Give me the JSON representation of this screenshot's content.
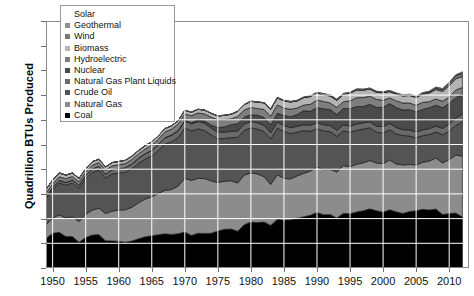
{
  "chart": {
    "title": "",
    "ylabel": "Quadrillion BTUs Produced",
    "xlabel": ""
  },
  "legend": {
    "title": "",
    "items": [
      {
        "label": "Solar",
        "color": "#ffffff"
      },
      {
        "label": "Geothermal",
        "color": "#8f8f8f"
      },
      {
        "label": "Wind",
        "color": "#787878"
      },
      {
        "label": "Biomass",
        "color": "#b4b4b4"
      },
      {
        "label": "Hydroelectric",
        "color": "#7e7e7e"
      },
      {
        "label": "Nuclear",
        "color": "#4a4a4a"
      },
      {
        "label": "Natural Gas Plant Liquids",
        "color": "#6a6a6a"
      },
      {
        "label": "Crude Oil",
        "color": "#545454"
      },
      {
        "label": "Natural Gas",
        "color": "#8c8c8c"
      },
      {
        "label": "Coal",
        "color": "#000000"
      }
    ]
  },
  "chart_data": {
    "type": "area",
    "title": "",
    "xlabel": "",
    "ylabel": "Quadrillion BTUs Produced",
    "xlim": [
      1949,
      2013
    ],
    "ylim": [
      0,
      100
    ],
    "yticks": [
      0,
      10,
      20,
      30,
      40,
      50,
      60,
      70,
      80,
      90,
      100
    ],
    "xticks": [
      1950,
      1955,
      1960,
      1965,
      1970,
      1975,
      1980,
      1985,
      1990,
      1995,
      2000,
      2005,
      2010
    ],
    "grid": true,
    "legend_position": "upper-left",
    "stacked": true,
    "stack_order_bottom_to_top": [
      "Coal",
      "Natural Gas",
      "Crude Oil",
      "Natural Gas Plant Liquids",
      "Nuclear",
      "Hydroelectric",
      "Biomass",
      "Wind",
      "Geothermal",
      "Solar"
    ],
    "x": [
      1949,
      1950,
      1951,
      1952,
      1953,
      1954,
      1955,
      1956,
      1957,
      1958,
      1959,
      1960,
      1961,
      1962,
      1963,
      1964,
      1965,
      1966,
      1967,
      1968,
      1969,
      1970,
      1971,
      1972,
      1973,
      1974,
      1975,
      1976,
      1977,
      1978,
      1979,
      1980,
      1981,
      1982,
      1983,
      1984,
      1985,
      1986,
      1987,
      1988,
      1989,
      1990,
      1991,
      1992,
      1993,
      1994,
      1995,
      1996,
      1997,
      1998,
      1999,
      2000,
      2001,
      2002,
      2003,
      2004,
      2005,
      2006,
      2007,
      2008,
      2009,
      2010,
      2011,
      2012
    ],
    "series": [
      {
        "name": "Coal",
        "color": "#000000",
        "values": [
          11.97,
          14.06,
          14.43,
          12.73,
          12.75,
          10.45,
          12.37,
          13.31,
          13.55,
          11.04,
          10.96,
          10.82,
          10.45,
          10.9,
          11.85,
          12.62,
          13.06,
          13.47,
          13.83,
          13.61,
          13.86,
          14.61,
          13.19,
          14.09,
          13.99,
          14.07,
          14.99,
          15.65,
          15.76,
          14.91,
          17.54,
          18.6,
          18.38,
          18.64,
          17.25,
          19.72,
          19.33,
          19.51,
          20.14,
          20.74,
          21.36,
          22.46,
          21.59,
          21.63,
          20.25,
          22.11,
          21.98,
          22.67,
          23.19,
          23.94,
          23.19,
          22.62,
          23.55,
          22.73,
          22.09,
          22.85,
          23.19,
          23.79,
          23.49,
          23.85,
          21.62,
          22.04,
          22.22,
          20.68
        ]
      },
      {
        "name": "Natural Gas",
        "color": "#8c8c8c",
        "values": [
          5.38,
          6.23,
          7.05,
          7.55,
          7.99,
          8.35,
          9.34,
          10.08,
          10.68,
          11.03,
          12.05,
          12.66,
          13.1,
          13.72,
          14.51,
          15.29,
          15.78,
          16.7,
          17.64,
          18.17,
          19.32,
          21.67,
          22.28,
          22.21,
          22.19,
          21.21,
          19.64,
          19.48,
          19.57,
          19.49,
          20.08,
          19.91,
          19.7,
          18.32,
          16.59,
          18.01,
          16.98,
          16.54,
          17.14,
          17.6,
          17.85,
          18.36,
          18.23,
          18.38,
          18.58,
          19.35,
          19.08,
          19.34,
          19.39,
          19.61,
          19.34,
          19.66,
          20.17,
          19.38,
          19.63,
          19.07,
          18.56,
          19.02,
          19.82,
          20.7,
          20.96,
          21.81,
          23.51,
          24.64
        ]
      },
      {
        "name": "Crude Oil",
        "color": "#545454",
        "values": [
          10.68,
          11.45,
          13.0,
          13.28,
          13.7,
          13.43,
          14.41,
          15.29,
          15.42,
          14.36,
          15.08,
          14.94,
          15.22,
          15.56,
          15.98,
          16.17,
          16.52,
          17.45,
          18.65,
          19.31,
          19.62,
          20.4,
          20.03,
          20.04,
          19.49,
          18.58,
          17.72,
          17.26,
          17.45,
          18.43,
          18.1,
          18.25,
          18.15,
          18.31,
          18.39,
          18.85,
          18.99,
          18.38,
          17.67,
          17.28,
          16.12,
          15.57,
          15.7,
          15.22,
          14.49,
          14.1,
          13.89,
          13.72,
          13.66,
          13.24,
          12.45,
          12.36,
          12.28,
          12.16,
          11.94,
          11.5,
          10.96,
          10.8,
          10.72,
          10.51,
          11.35,
          11.59,
          11.99,
          13.78
        ]
      },
      {
        "name": "Natural Gas Plant Liquids",
        "color": "#6a6a6a",
        "values": [
          0.8,
          0.88,
          1.01,
          1.08,
          1.17,
          1.22,
          1.32,
          1.43,
          1.51,
          1.52,
          1.67,
          1.75,
          1.82,
          1.92,
          2.05,
          2.14,
          2.25,
          2.4,
          2.54,
          2.65,
          2.73,
          2.84,
          2.91,
          2.97,
          2.93,
          2.75,
          2.63,
          2.61,
          2.56,
          2.57,
          2.56,
          2.57,
          2.58,
          2.51,
          2.48,
          2.5,
          2.38,
          2.4,
          2.44,
          2.43,
          2.41,
          2.44,
          2.46,
          2.46,
          2.41,
          2.39,
          2.44,
          2.53,
          2.52,
          2.42,
          2.39,
          2.61,
          2.55,
          2.56,
          2.35,
          2.47,
          2.33,
          2.36,
          2.41,
          2.42,
          2.57,
          2.78,
          2.95,
          3.26
        ]
      },
      {
        "name": "Nuclear",
        "color": "#4a4a4a",
        "values": [
          0.0,
          0.0,
          0.0,
          0.0,
          0.0,
          0.0,
          0.0,
          0.0,
          0.0,
          0.0,
          0.0,
          0.01,
          0.02,
          0.03,
          0.04,
          0.04,
          0.04,
          0.06,
          0.09,
          0.14,
          0.15,
          0.24,
          0.41,
          0.58,
          0.91,
          1.27,
          1.9,
          2.11,
          2.7,
          3.02,
          2.78,
          2.74,
          3.01,
          3.13,
          3.2,
          3.55,
          4.08,
          4.38,
          4.75,
          5.59,
          5.68,
          6.1,
          6.42,
          6.48,
          6.41,
          6.69,
          7.08,
          7.09,
          6.6,
          7.07,
          7.61,
          7.86,
          8.03,
          8.14,
          7.96,
          8.22,
          8.16,
          8.22,
          8.46,
          8.43,
          8.35,
          8.43,
          8.26,
          8.06
        ]
      },
      {
        "name": "Hydroelectric",
        "color": "#7e7e7e",
        "values": [
          1.43,
          1.42,
          1.45,
          1.5,
          1.44,
          1.39,
          1.36,
          1.49,
          1.56,
          1.64,
          1.59,
          1.61,
          1.66,
          1.82,
          1.77,
          1.9,
          2.06,
          2.07,
          2.35,
          2.35,
          2.65,
          2.63,
          2.82,
          2.86,
          2.86,
          3.18,
          3.15,
          2.98,
          2.33,
          2.94,
          2.93,
          2.9,
          2.76,
          3.27,
          3.53,
          3.39,
          2.97,
          3.07,
          2.63,
          2.33,
          2.84,
          3.05,
          3.02,
          2.62,
          2.89,
          2.68,
          3.21,
          3.59,
          3.64,
          3.3,
          3.27,
          2.81,
          2.24,
          2.69,
          2.83,
          2.69,
          2.7,
          2.87,
          2.45,
          2.51,
          2.67,
          2.54,
          3.1,
          2.67
        ]
      },
      {
        "name": "Biomass",
        "color": "#b4b4b4",
        "values": [
          1.55,
          1.56,
          1.56,
          1.47,
          1.4,
          1.4,
          1.42,
          1.41,
          1.33,
          1.32,
          1.32,
          1.32,
          1.32,
          1.33,
          1.34,
          1.37,
          1.34,
          1.36,
          1.33,
          1.33,
          1.34,
          1.43,
          1.43,
          1.5,
          1.53,
          1.54,
          1.5,
          1.71,
          1.84,
          2.04,
          2.15,
          2.48,
          2.59,
          2.66,
          2.81,
          2.88,
          2.95,
          2.94,
          2.88,
          3.02,
          3.16,
          2.74,
          2.78,
          2.84,
          2.86,
          2.93,
          3.1,
          3.15,
          3.01,
          2.87,
          2.89,
          3.01,
          2.62,
          2.7,
          2.82,
          3.02,
          3.12,
          3.27,
          3.5,
          3.85,
          3.95,
          4.52,
          4.55,
          4.42
        ]
      },
      {
        "name": "Wind",
        "color": "#787878",
        "values": [
          0.0,
          0.0,
          0.0,
          0.0,
          0.0,
          0.0,
          0.0,
          0.0,
          0.0,
          0.0,
          0.0,
          0.0,
          0.0,
          0.0,
          0.0,
          0.0,
          0.0,
          0.0,
          0.0,
          0.0,
          0.0,
          0.0,
          0.0,
          0.0,
          0.0,
          0.0,
          0.0,
          0.0,
          0.0,
          0.0,
          0.0,
          0.0,
          0.0,
          0.0,
          0.0,
          0.0,
          0.0,
          0.0,
          0.0,
          0.0,
          0.02,
          0.03,
          0.03,
          0.03,
          0.03,
          0.04,
          0.03,
          0.03,
          0.03,
          0.03,
          0.05,
          0.06,
          0.07,
          0.11,
          0.12,
          0.14,
          0.18,
          0.26,
          0.34,
          0.55,
          0.72,
          0.92,
          1.17,
          1.34
        ]
      },
      {
        "name": "Geothermal",
        "color": "#8f8f8f",
        "values": [
          0.0,
          0.0,
          0.0,
          0.0,
          0.0,
          0.0,
          0.0,
          0.0,
          0.0,
          0.0,
          0.0,
          0.0,
          0.0,
          0.0,
          0.0,
          0.0,
          0.0,
          0.0,
          0.0,
          0.0,
          0.01,
          0.01,
          0.01,
          0.03,
          0.04,
          0.05,
          0.07,
          0.08,
          0.08,
          0.06,
          0.08,
          0.11,
          0.12,
          0.1,
          0.13,
          0.16,
          0.2,
          0.22,
          0.23,
          0.22,
          0.32,
          0.34,
          0.35,
          0.35,
          0.36,
          0.34,
          0.29,
          0.32,
          0.32,
          0.33,
          0.33,
          0.32,
          0.31,
          0.33,
          0.33,
          0.34,
          0.34,
          0.34,
          0.35,
          0.36,
          0.37,
          0.37,
          0.37,
          0.37
        ]
      },
      {
        "name": "Solar",
        "color": "#ffffff",
        "values": [
          0.0,
          0.0,
          0.0,
          0.0,
          0.0,
          0.0,
          0.0,
          0.0,
          0.0,
          0.0,
          0.0,
          0.0,
          0.0,
          0.0,
          0.0,
          0.0,
          0.0,
          0.0,
          0.0,
          0.0,
          0.0,
          0.0,
          0.0,
          0.0,
          0.0,
          0.0,
          0.0,
          0.0,
          0.0,
          0.0,
          0.0,
          0.0,
          0.0,
          0.0,
          0.0,
          0.0,
          0.0,
          0.0,
          0.0,
          0.0,
          0.0,
          0.06,
          0.06,
          0.06,
          0.06,
          0.07,
          0.07,
          0.07,
          0.07,
          0.07,
          0.07,
          0.07,
          0.07,
          0.06,
          0.06,
          0.06,
          0.07,
          0.07,
          0.08,
          0.09,
          0.1,
          0.13,
          0.16,
          0.24
        ]
      }
    ]
  }
}
